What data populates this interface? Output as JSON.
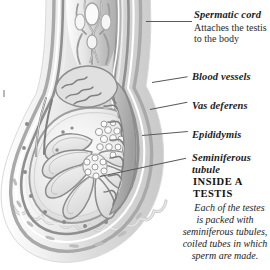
{
  "figure": {
    "background_color": "#ffffff",
    "ink_color": "#5a5a5a",
    "text_color": "#1c1c1c"
  },
  "labels": [
    {
      "id": "spermatic-cord",
      "term": "Spermatic cord",
      "description": "Attaches the testis",
      "description_line2": "to the body"
    },
    {
      "id": "blood-vessels",
      "term": "Blood vessels"
    },
    {
      "id": "vas-deferens",
      "term": "Vas deferens"
    },
    {
      "id": "epididymis",
      "term": "Epididymis"
    },
    {
      "id": "seminiferous-tubule",
      "term": "Seminiferous",
      "term_line2": "tubule"
    }
  ],
  "callout": {
    "heading_line1": "INSIDE A",
    "heading_line2": "TESTIS",
    "body": "Each of the testes is packed with seminiferous tubules, coiled tubes in which sperm are made."
  }
}
